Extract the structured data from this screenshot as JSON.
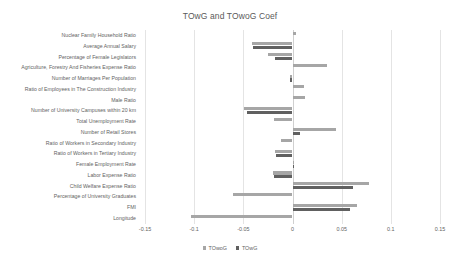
{
  "chart": {
    "title": "TOwG and TOwoG Coef"
  },
  "legend": {
    "position": "bottom",
    "items": [
      {
        "label": "TOwoG",
        "color": "#a6a6a6"
      },
      {
        "label": "TOwG",
        "color": "#606060"
      }
    ]
  },
  "axis": {
    "ticks": [
      "-0.15",
      "-0.1",
      "-0.05",
      "0",
      "0.05",
      "0.1",
      "0.15"
    ],
    "min": -0.15,
    "max": 0.15
  },
  "chart_data": {
    "type": "bar",
    "orientation": "horizontal",
    "title": "TOwG and TOwoG Coef",
    "xlabel": "",
    "ylabel": "",
    "xlim": [
      -0.15,
      0.15
    ],
    "xticks": [
      -0.15,
      -0.1,
      -0.05,
      0,
      0.05,
      0.1,
      0.15
    ],
    "grid": true,
    "legend_position": "bottom",
    "categories": [
      "Nuclear Family Household Ratio",
      "Average Annual Salary",
      "Percentage of Female Legislators",
      "Agriculture, Forestry And Fisheries Expense Ratio",
      "Number of Marriages Per Population",
      "Ratio of Employees in The Construction Industry",
      "Male Ratio",
      "Number of University Campuses within 20 km",
      "Total Unemployment Rate",
      "Number of Retail Stores",
      "Ratio of Workers in Secondary Industry",
      "Ratio of Workers in Tertiary Industry",
      "Female Employment Rate",
      "Labor Expense Ratio",
      "Child Welfare Expense Ratio",
      "Percentage of University Graduates",
      "FMI",
      "Longitude"
    ],
    "series": [
      {
        "name": "TOwoG",
        "color": "#a6a6a6",
        "values": [
          0.004,
          -0.041,
          -0.025,
          0.035,
          -0.003,
          0.012,
          0.013,
          -0.049,
          -0.019,
          0.044,
          -0.012,
          -0.018,
          0.001,
          -0.02,
          0.078,
          -0.061,
          0.066,
          -0.103
        ]
      },
      {
        "name": "TOwG",
        "color": "#606060",
        "values": [
          0.0,
          -0.04,
          -0.018,
          0.0,
          -0.003,
          0.0,
          0.0,
          -0.046,
          0.0,
          0.008,
          0.0,
          -0.017,
          0.001,
          -0.019,
          0.062,
          0.0,
          0.058,
          0.0
        ]
      }
    ]
  }
}
